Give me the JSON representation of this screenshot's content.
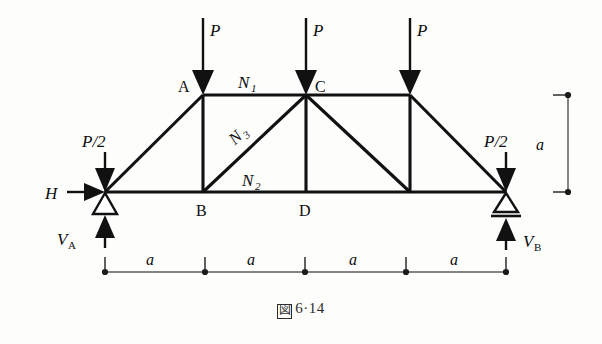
{
  "figure": {
    "caption_glyph": "図",
    "caption_text": "6·14",
    "caption_full": "図 6·14"
  },
  "labels": {
    "node_a": "A",
    "node_b": "B",
    "node_c": "C",
    "node_d": "D",
    "member_n1_base": "N",
    "member_n1_sub": "1",
    "member_n2_base": "N",
    "member_n2_sub": "2",
    "member_n3_base": "N",
    "member_n3_sub": "3"
  },
  "loads": {
    "p1": "P",
    "p2": "P",
    "p3": "P",
    "p_half_left": "P/2",
    "p_half_right": "P/2",
    "horizontal": "H",
    "reaction_a_base": "V",
    "reaction_a_sub": "A",
    "reaction_b_base": "V",
    "reaction_b_sub": "B"
  },
  "dimensions": {
    "span_1": "a",
    "span_2": "a",
    "span_3": "a",
    "span_4": "a",
    "height": "a",
    "span_count": 4,
    "total_span": "4a"
  },
  "geometry": {
    "top_chord_y": 95,
    "bottom_chord_y": 192,
    "left_support_x": 105,
    "right_support_x": 506,
    "node_a_x": 203,
    "node_c_x": 306,
    "node_e_x": 410,
    "panel_width": 100
  },
  "colors": {
    "member_stroke": "#111111",
    "dimension_line": "#5b5b5b",
    "background": "#fdfdfc",
    "caption_text": "#2b2b2b"
  },
  "supports": {
    "left_type": "pin",
    "right_type": "roller"
  }
}
